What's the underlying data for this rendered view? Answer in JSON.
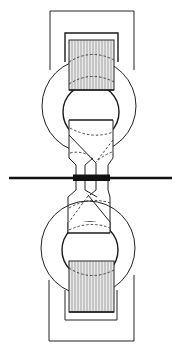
{
  "diagram": {
    "title": "",
    "colors": {
      "background": "#ffffff",
      "stroke": "#222222",
      "hatch_fill": "#e9e9e9",
      "hatch_line": "#777777"
    },
    "components": [
      {
        "id": "upper-outer-frame",
        "type": "rectangle-open"
      },
      {
        "id": "upper-inner-frame",
        "type": "rectangle-open"
      },
      {
        "id": "upper-coil-block",
        "type": "hatched-rectangle"
      },
      {
        "id": "upper-ring",
        "type": "annulus"
      },
      {
        "id": "upper-connector",
        "type": "tapered-box"
      },
      {
        "id": "central-bar",
        "type": "horizontal-bar"
      },
      {
        "id": "lower-connector",
        "type": "tapered-box"
      },
      {
        "id": "lower-ring",
        "type": "annulus"
      },
      {
        "id": "lower-coil-block",
        "type": "hatched-rectangle"
      },
      {
        "id": "lower-inner-frame",
        "type": "rectangle-open"
      },
      {
        "id": "lower-outer-frame",
        "type": "rectangle-open"
      }
    ],
    "labels": []
  }
}
